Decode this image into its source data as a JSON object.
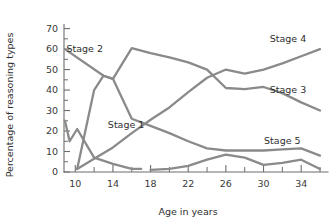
{
  "chart_data": {
    "type": "line",
    "title": "",
    "xlabel": "Age in years",
    "ylabel": "Percentage of reasoning types",
    "xlim": [
      8.8,
      36
    ],
    "ylim": [
      0,
      72
    ],
    "grid": false,
    "legend_position": "inline-right",
    "x_ticks_major": [
      10,
      14,
      18,
      22,
      26,
      30,
      34
    ],
    "x_ticks_minor": [
      12,
      16,
      20,
      24,
      28,
      32,
      36
    ],
    "y_ticks_major": [
      0,
      10,
      20,
      30,
      40,
      50,
      60,
      70
    ],
    "y_ticks_minor": [
      5,
      15,
      25,
      35,
      45,
      55,
      65
    ],
    "x_tick_labels": [
      "10",
      "14",
      "18",
      "22",
      "26",
      "30",
      "34"
    ],
    "y_tick_labels": [
      "0",
      "10",
      "20",
      "30",
      "40",
      "50",
      "60",
      "70"
    ],
    "line_color": "#8a8a8a",
    "series": [
      {
        "name": "Stage 1",
        "label": "Stage 1",
        "label_x": 15.4,
        "label_y": 21.5,
        "x": [
          8.9,
          9.4,
          10.2,
          12.0,
          14.0,
          16.0,
          17.0
        ],
        "values": [
          25,
          15,
          21,
          7,
          4,
          1.5,
          1.5
        ]
      },
      {
        "name": "Stage 2",
        "label": "Stage 2",
        "label_x": 11.0,
        "label_y": 58.5,
        "x": [
          8.9,
          13.0,
          14.0,
          16.0,
          18.0,
          20.0,
          22.0,
          24.0,
          26.0,
          28.0,
          30.0,
          32.0,
          34.0,
          36.0
        ],
        "values": [
          60,
          47,
          45.5,
          26,
          22.5,
          19,
          15,
          11.5,
          10.5,
          10.5,
          10.5,
          11,
          11.5,
          8
        ]
      },
      {
        "name": "Stage 3",
        "label": "Stage 3",
        "label_x": 32.6,
        "label_y": 38.5,
        "x": [
          10.2,
          12.0,
          13.0,
          14.0,
          16.0,
          18.0,
          20.0,
          22.0,
          24.0,
          26.0,
          28.0,
          30.0,
          32.0,
          34.0,
          36.0
        ],
        "values": [
          1.5,
          40,
          47,
          45.5,
          60.5,
          58,
          56,
          53.5,
          50,
          41,
          40.5,
          41.5,
          38.5,
          34,
          30
        ]
      },
      {
        "name": "Stage 4",
        "label": "Stage 4",
        "label_x": 32.6,
        "label_y": 63.5,
        "x": [
          10.2,
          12.0,
          14.0,
          16.0,
          18.0,
          20.0,
          22.0,
          24.0,
          26.0,
          28.0,
          30.0,
          32.0,
          34.0,
          36.0
        ],
        "values": [
          1.5,
          6.5,
          12,
          19,
          25.5,
          31.5,
          39,
          46,
          50,
          48,
          50,
          53,
          56.5,
          60
        ]
      },
      {
        "name": "Stage 5",
        "label": "Stage 5",
        "label_x": 32.0,
        "label_y": 13.5,
        "x": [
          18.0,
          20.0,
          22.0,
          24.0,
          26.0,
          28.0,
          30.0,
          32.0,
          34.0,
          36.0
        ],
        "values": [
          1,
          1.5,
          3,
          6,
          8.5,
          7,
          3.5,
          4.5,
          6,
          1.5
        ]
      }
    ]
  }
}
